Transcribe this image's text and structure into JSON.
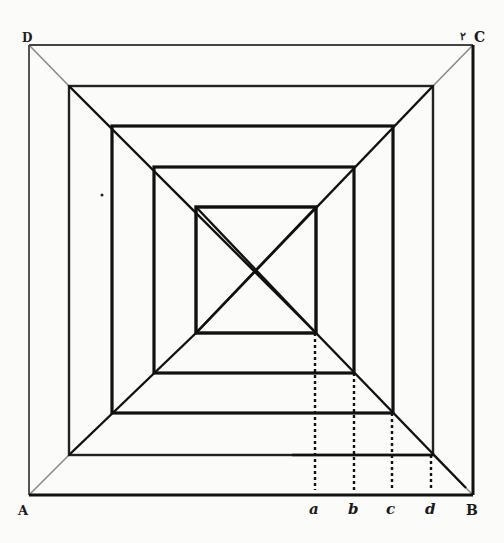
{
  "figure": {
    "colors": {
      "background": "#fbfbf9",
      "ink": "#111111",
      "faint_ink": "#8a8a8a"
    },
    "corner_labels": {
      "D": "D",
      "C": "C",
      "A": "A",
      "B": "B"
    },
    "projection_labels": [
      "a",
      "b",
      "c",
      "d"
    ],
    "squares": [
      {
        "name": "square-1-outer",
        "x1": 29,
        "y1": 45,
        "x2": 473,
        "y2": 495
      },
      {
        "name": "square-2",
        "x1": 69,
        "y1": 86,
        "x2": 433,
        "y2": 455
      },
      {
        "name": "square-3",
        "x1": 112,
        "y1": 126,
        "x2": 393,
        "y2": 413
      },
      {
        "name": "square-4",
        "x1": 154,
        "y1": 167,
        "x2": 354,
        "y2": 373
      },
      {
        "name": "square-5-inner",
        "x1": 196,
        "y1": 207,
        "x2": 316,
        "y2": 333
      }
    ],
    "projection_x": [
      315,
      354,
      392,
      431
    ],
    "baseline_y": 495
  }
}
